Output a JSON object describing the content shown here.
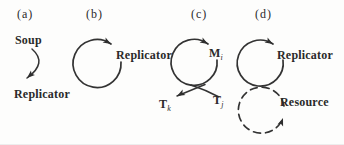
{
  "figure": {
    "ink_color": "#2a2a2a",
    "background_color": "#fdfdfc",
    "panels": {
      "a": {
        "label": "(a)",
        "source": "Soup",
        "product": "Replicator"
      },
      "b": {
        "label": "(b)",
        "cycle": "Replicator"
      },
      "c": {
        "label": "(c)",
        "cycle_main": "M",
        "cycle_sub": "i",
        "output_main": "T",
        "output_sub": "k",
        "input_main": "T",
        "input_sub": "j"
      },
      "d": {
        "label": "(d)",
        "upper_cycle": "Replicator",
        "lower_cycle": "Resource"
      }
    }
  }
}
